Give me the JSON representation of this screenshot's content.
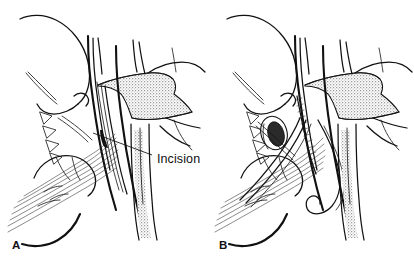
{
  "figure": {
    "type": "surgical line illustration",
    "background_color": "#ffffff",
    "ink_color": "#111111",
    "stipple_color": "#8f8f8f",
    "width": 414,
    "height": 262
  },
  "panels": [
    {
      "id": "A",
      "letter": "A",
      "letter_x": 12,
      "letter_y": 247,
      "region": {
        "x": 0,
        "y": 0,
        "width": 207,
        "height": 262
      },
      "annotations": [
        {
          "name": "incision",
          "label": "Incision",
          "label_x": 157,
          "label_y": 160,
          "leader_from": {
            "x": 152,
            "y": 155
          },
          "leader_to": {
            "x": 93,
            "y": 133
          }
        }
      ]
    },
    {
      "id": "B",
      "letter": "B",
      "letter_x": 219,
      "letter_y": 247,
      "region": {
        "x": 207,
        "y": 0,
        "width": 207,
        "height": 262
      },
      "annotations": []
    }
  ],
  "labels": {
    "incision": "Incision",
    "panel_a": "A",
    "panel_b": "B"
  },
  "icons": {
    "stipple_region": "hatched-tissue-icon",
    "lumen_opening": "oval-lumen-icon",
    "suture_thread": "suture-thread-icon"
  }
}
